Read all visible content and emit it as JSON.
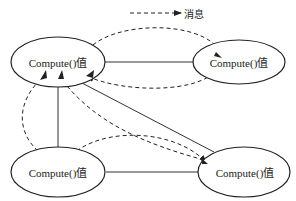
{
  "legend": {
    "line_style": "dashed-arrow",
    "label": "消息"
  },
  "nodes": [
    {
      "id": "top-left",
      "label": "Compute()值"
    },
    {
      "id": "top-right",
      "label": "Compute()值"
    },
    {
      "id": "bottom-left",
      "label": "Compute()值"
    },
    {
      "id": "bottom-right",
      "label": "Compute()值"
    }
  ],
  "edges_solid": [
    {
      "from": "top-left",
      "to": "top-right"
    },
    {
      "from": "top-left",
      "to": "bottom-left"
    },
    {
      "from": "top-left",
      "to": "bottom-right"
    },
    {
      "from": "bottom-left",
      "to": "bottom-right"
    }
  ],
  "messages_dashed": [
    {
      "from": "top-left",
      "to": "top-right"
    },
    {
      "from": "top-right",
      "to": "top-left"
    },
    {
      "from": "bottom-left",
      "to": "top-left"
    },
    {
      "from": "bottom-right",
      "to": "top-left"
    },
    {
      "from": "bottom-left",
      "to": "bottom-right"
    },
    {
      "from": "bottom-left",
      "to": "top-left"
    }
  ],
  "colors": {
    "stroke": "#222222",
    "background": "#ffffff"
  }
}
